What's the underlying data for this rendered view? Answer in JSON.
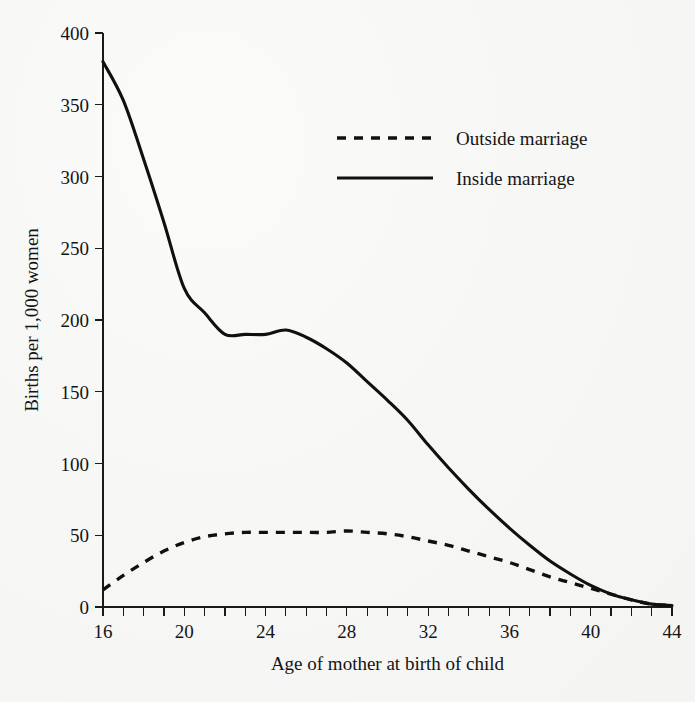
{
  "figure": {
    "background_color": "#f6f6f5",
    "ink_color": "#101010",
    "cropped_title_fragment": ""
  },
  "axes": {
    "x": {
      "label": "Age of mother at birth of child",
      "min": 16,
      "max": 44,
      "tick_labels": [
        "16",
        "20",
        "24",
        "28",
        "32",
        "36",
        "40",
        "44"
      ],
      "tick_values": [
        16,
        20,
        24,
        28,
        32,
        36,
        40,
        44
      ],
      "minor_tick_step": 1
    },
    "y": {
      "label": "Births per 1,000 women",
      "min": 0,
      "max": 400,
      "tick_labels": [
        "0",
        "50",
        "100",
        "150",
        "200",
        "250",
        "300",
        "350",
        "400"
      ],
      "tick_values": [
        0,
        50,
        100,
        150,
        200,
        250,
        300,
        350,
        400
      ]
    }
  },
  "legend": {
    "position": "upper-right-inside",
    "entries": [
      {
        "label": "Outside marriage",
        "style": "dashed"
      },
      {
        "label": "Inside marriage",
        "style": "solid"
      }
    ]
  },
  "chart_data": {
    "type": "line",
    "title": "",
    "xlabel": "Age of mother at birth of child",
    "ylabel": "Births per 1,000 women",
    "xlim": [
      16,
      44
    ],
    "ylim": [
      0,
      400
    ],
    "grid": false,
    "legend_position": "upper-right-inside",
    "x": [
      16,
      17,
      18,
      19,
      20,
      21,
      22,
      23,
      24,
      25,
      26,
      27,
      28,
      29,
      30,
      31,
      32,
      33,
      34,
      35,
      36,
      37,
      38,
      39,
      40,
      41,
      42,
      43,
      44
    ],
    "series": [
      {
        "name": "Inside marriage",
        "style": "solid",
        "values": [
          380,
          353,
          312,
          268,
          222,
          205,
          190,
          190,
          190,
          193,
          188,
          180,
          170,
          157,
          144,
          130,
          113,
          97,
          82,
          68,
          55,
          43,
          32,
          23,
          15,
          9,
          5,
          2,
          1
        ]
      },
      {
        "name": "Outside marriage",
        "style": "dashed",
        "values": [
          12,
          22,
          31,
          39,
          45,
          49,
          51,
          52,
          52,
          52,
          52,
          52,
          53,
          52,
          51,
          49,
          46,
          43,
          39,
          35,
          31,
          26,
          21,
          17,
          13,
          9,
          5,
          2,
          1
        ]
      }
    ]
  }
}
